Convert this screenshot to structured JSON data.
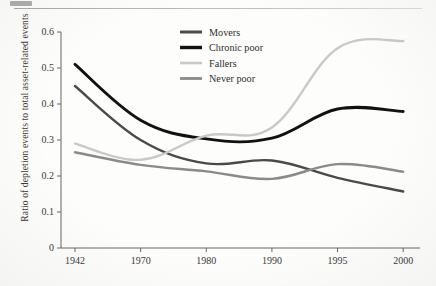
{
  "figure": {
    "background_color": "#fdfdfb",
    "has_top_rule": true
  },
  "chart_data": {
    "type": "line",
    "title": "",
    "xlabel": "",
    "ylabel": "Ratio of depletion events to total asset-related events",
    "categories": [
      "1942",
      "1970",
      "1980",
      "1990",
      "1995",
      "2000"
    ],
    "x_tick_labels": [
      "1942",
      "1970",
      "1980",
      "1990",
      "1995",
      "2000"
    ],
    "y_tick_labels": [
      "0",
      "0.1",
      "0.2",
      "0.3",
      "0.4",
      "0.5",
      "0.6"
    ],
    "y_tick_values": [
      0,
      0.1,
      0.2,
      0.3,
      0.4,
      0.5,
      0.6
    ],
    "ylim": [
      0,
      0.6
    ],
    "grid": false,
    "legend_position": "top-center",
    "axis_style": "left-and-bottom-spines",
    "series": [
      {
        "name": "Movers",
        "color": "#4a4a4a",
        "values": [
          0.45,
          0.3,
          0.235,
          0.243,
          0.195,
          0.157
        ]
      },
      {
        "name": "Chronic poor",
        "color": "#111111",
        "values": [
          0.51,
          0.355,
          0.303,
          0.305,
          0.386,
          0.379
        ]
      },
      {
        "name": "Fallers",
        "color": "#c9c9c9",
        "values": [
          0.29,
          0.245,
          0.312,
          0.335,
          0.555,
          0.575
        ]
      },
      {
        "name": "Never poor",
        "color": "#8a8a8a",
        "values": [
          0.266,
          0.231,
          0.213,
          0.192,
          0.233,
          0.212
        ]
      }
    ]
  },
  "legend": {
    "entries": [
      {
        "label": "Movers",
        "color": "#4a4a4a",
        "width": 3.0
      },
      {
        "label": "Chronic poor",
        "color": "#111111",
        "width": 3.4
      },
      {
        "label": "Fallers",
        "color": "#c9c9c9",
        "width": 2.6
      },
      {
        "label": "Never poor",
        "color": "#8a8a8a",
        "width": 2.8
      }
    ]
  }
}
